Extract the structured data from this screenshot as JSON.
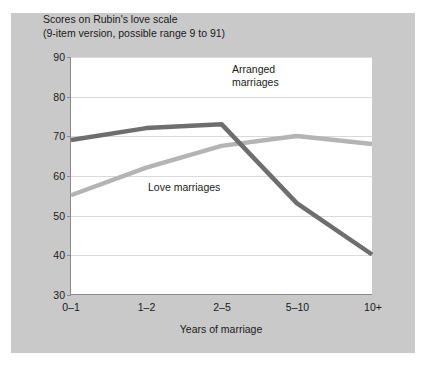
{
  "figure": {
    "title": "Scores on Rubin's love scale\n(9-item version, possible range 9 to 91)",
    "xlabel": "Years of marriage",
    "annotations": {
      "arranged": "Arranged\nmarriages",
      "love": "Love marriages"
    }
  },
  "colors": {
    "panel": "#c9c9c9",
    "plot": "#ffffff",
    "grid": "#d9d9d9",
    "axis": "#8a8a8a",
    "love_marriages": "#6e6e6e",
    "arranged_marriages": "#b4b4b4"
  },
  "chart_data": {
    "type": "line",
    "title": "Scores on Rubin's love scale (9-item version, possible range 9 to 91)",
    "xlabel": "Years of marriage",
    "ylabel": "",
    "categories": [
      "0–1",
      "1–2",
      "2–5",
      "5–10",
      "10+"
    ],
    "yticks": [
      30,
      40,
      50,
      60,
      70,
      80,
      90
    ],
    "ylim": [
      30,
      90
    ],
    "grid": true,
    "legend": "inline-annotations",
    "series": [
      {
        "name": "Love marriages",
        "color": "#6e6e6e",
        "values": [
          69,
          72,
          73,
          53,
          40
        ]
      },
      {
        "name": "Arranged marriages",
        "color": "#b4b4b4",
        "values": [
          55,
          62,
          67.5,
          70,
          68
        ]
      }
    ]
  }
}
